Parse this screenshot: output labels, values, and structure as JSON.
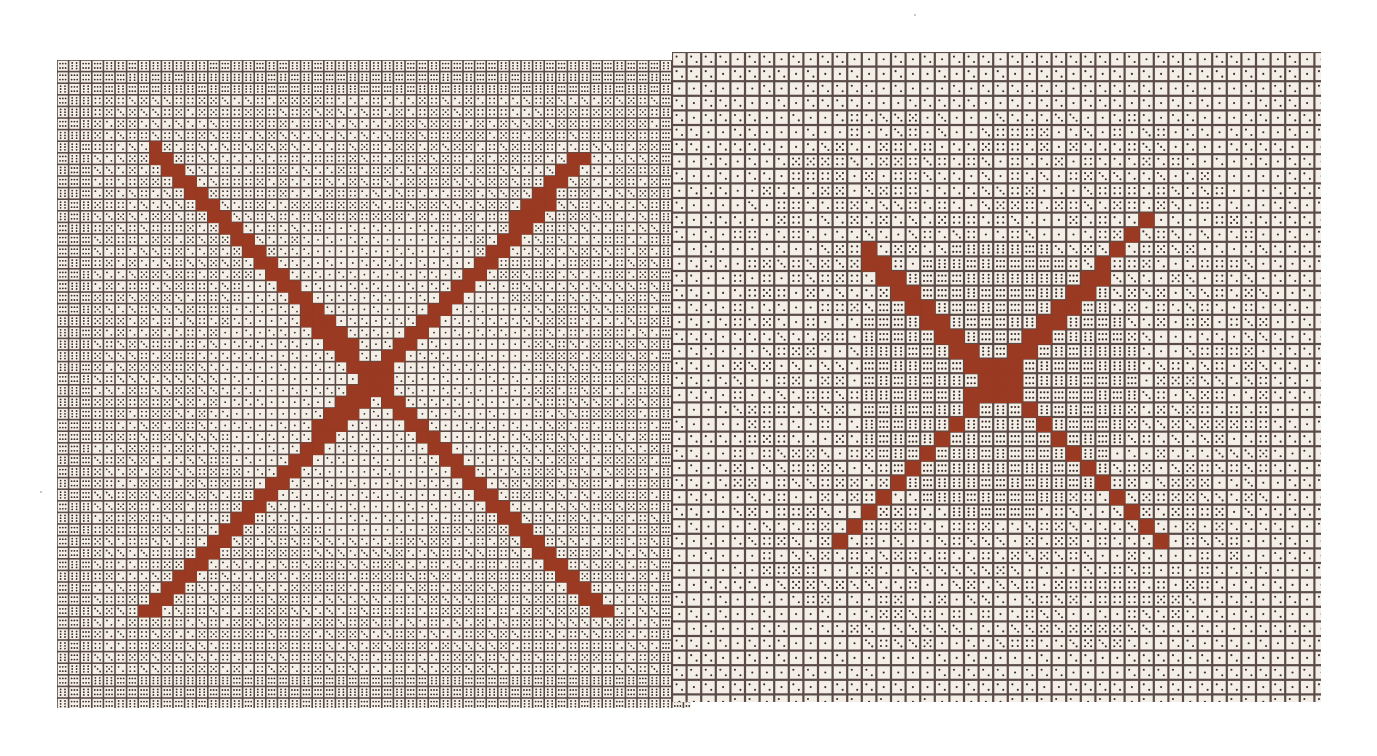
{
  "artwork": {
    "subject": "dice mosaic diptych",
    "background": "#ffffff",
    "colors": {
      "die_face": "#f3efe6",
      "pip": "#3a2c2a",
      "grid_line": "#5a4a48",
      "cross_fill": "#9a3a22"
    },
    "panels": [
      {
        "name": "left-panel",
        "x": 57,
        "y": 60,
        "width": 634,
        "height": 648,
        "cell": 11.6,
        "center": [
          375,
          380
        ],
        "center_size": 40,
        "arm_width": 9,
        "arm_reach": [
          [
            155,
            150
          ],
          [
            580,
            160
          ],
          [
            150,
            610
          ],
          [
            600,
            610
          ]
        ],
        "style": "dense"
      },
      {
        "name": "right-panel",
        "x": 672,
        "y": 52,
        "width": 649,
        "height": 650,
        "cell": 14.6,
        "center": [
          995,
          380
        ],
        "center_size": 46,
        "arm_width": 7,
        "arm_reach": [
          [
            865,
            250
          ],
          [
            1145,
            225
          ],
          [
            840,
            545
          ],
          [
            1170,
            550
          ]
        ],
        "style": "open"
      }
    ],
    "specks": [
      [
        914,
        14
      ],
      [
        40,
        491
      ]
    ]
  }
}
